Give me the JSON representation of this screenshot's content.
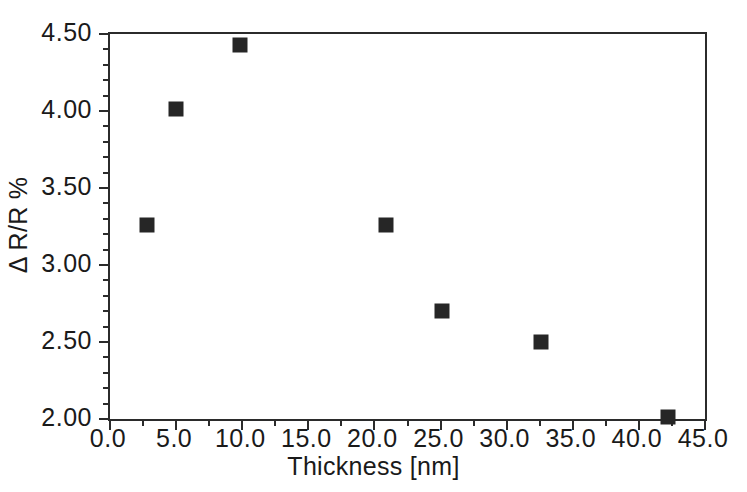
{
  "chart_data": {
    "type": "scatter",
    "title": "",
    "xlabel": "Thickness [nm]",
    "ylabel": "Δ R/R %",
    "xlim": [
      0.0,
      45.0
    ],
    "ylim": [
      2.0,
      4.5
    ],
    "grid": false,
    "legend": null,
    "x_ticks": [
      "0.0",
      "5.0",
      "10.0",
      "15.0",
      "20.0",
      "25.0",
      "30.0",
      "35.0",
      "40.0",
      "45.0"
    ],
    "x_tick_values": [
      0.0,
      5.0,
      10.0,
      15.0,
      20.0,
      25.0,
      30.0,
      35.0,
      40.0,
      45.0
    ],
    "x_minor_step": 2.5,
    "y_ticks": [
      "2.00",
      "2.50",
      "3.00",
      "3.50",
      "4.00",
      "4.50"
    ],
    "y_tick_values": [
      2.0,
      2.5,
      3.0,
      3.5,
      4.0,
      4.5
    ],
    "y_minor_step": 0.1,
    "marker": "filled-square",
    "marker_color": "#262626",
    "axis_color": "#2b2b2b",
    "series": [
      {
        "name": "",
        "points": [
          {
            "x": 2.8,
            "y": 3.26
          },
          {
            "x": 5.0,
            "y": 4.01
          },
          {
            "x": 9.8,
            "y": 4.43
          },
          {
            "x": 20.9,
            "y": 3.26
          },
          {
            "x": 25.1,
            "y": 2.7
          },
          {
            "x": 32.6,
            "y": 2.5
          },
          {
            "x": 42.2,
            "y": 2.01
          }
        ]
      }
    ]
  }
}
